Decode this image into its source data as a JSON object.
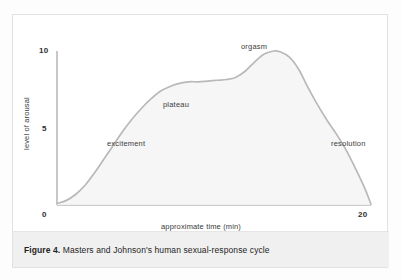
{
  "figure": {
    "caption_label": "Figure 4.",
    "caption_text": "Masters and Johnson's human sexual-response cycle",
    "border_color": "#e2e2e2",
    "caption_band_color": "#f0f0f0"
  },
  "chart_data": {
    "type": "line",
    "title": "",
    "subtitle": "",
    "xlabel": "approximate time (min)",
    "ylabel": "level of arousal",
    "xlim": [
      0,
      20
    ],
    "ylim": [
      0,
      10
    ],
    "xticks": [
      "0",
      "20"
    ],
    "yticks": [
      "0",
      "5",
      "10"
    ],
    "xtick_values": [
      0,
      20
    ],
    "ytick_values": [
      0,
      5,
      10
    ],
    "grid": false,
    "legend": "none",
    "line_color": "#b9b9b9",
    "axis_color": "#9a9a9a",
    "series": [
      {
        "name": "arousal",
        "x": [
          0,
          0.6,
          1.2,
          1.8,
          2.4,
          3.0,
          3.6,
          4.2,
          4.8,
          5.4,
          6.0,
          6.6,
          7.2,
          7.8,
          8.4,
          9.0,
          9.6,
          10.2,
          10.8,
          11.4,
          12.0,
          12.6,
          13.2,
          13.8,
          14.2,
          14.8,
          15.4,
          16.0,
          16.6,
          17.2,
          17.8,
          18.4,
          19.0,
          19.6,
          20.0
        ],
        "y": [
          0.1,
          0.3,
          0.7,
          1.3,
          2.1,
          3.0,
          3.9,
          4.8,
          5.6,
          6.3,
          6.9,
          7.4,
          7.7,
          7.9,
          8.0,
          8.0,
          8.05,
          8.1,
          8.15,
          8.3,
          8.7,
          9.3,
          9.8,
          10.0,
          9.95,
          9.6,
          8.8,
          7.6,
          6.5,
          5.5,
          4.6,
          3.6,
          2.4,
          1.1,
          0.05
        ]
      }
    ],
    "annotations": [
      {
        "label": "excitement",
        "x": 5.0,
        "y": 4.2
      },
      {
        "label": "plateau",
        "x": 8.5,
        "y": 6.7
      },
      {
        "label": "orgasm",
        "x": 13.5,
        "y": 10.7
      },
      {
        "label": "resolution",
        "x": 18.2,
        "y": 4.2
      }
    ]
  }
}
